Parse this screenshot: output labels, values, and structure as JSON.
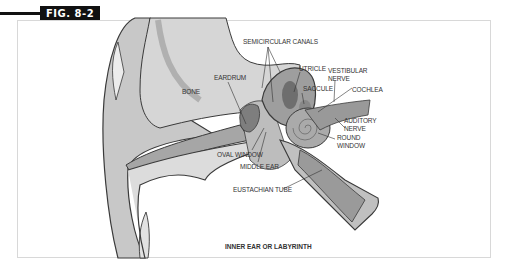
{
  "figure": {
    "badge": "FIG. 8-2",
    "caption": "INNER EAR OR LABYRINTH"
  },
  "labels": {
    "semicircular_canals": "SEMICIRCULAR CANALS",
    "eardrum": "EARDRUM",
    "bone": "BONE",
    "utricle": "UTRICLE",
    "vestibular_nerve_1": "VESTIBULAR",
    "vestibular_nerve_2": "NERVE",
    "saccule": "SACCULE",
    "cochlea": "COCHLEA",
    "auditory_nerve_1": "AUDITORY",
    "auditory_nerve_2": "NERVE",
    "round_window_1": "ROUND",
    "round_window_2": "WINDOW",
    "oval_window": "OVAL WINDOW",
    "middle_ear": "MIDDLE EAR",
    "eustachian_tube": "EUSTACHIAN TUBE"
  },
  "colors": {
    "badge_bg": "#111111",
    "outline": "#3a3a3a",
    "light_gray": "#d9d9d9",
    "mid_gray": "#b4b4b4",
    "dark_gray": "#8c8c8c"
  }
}
